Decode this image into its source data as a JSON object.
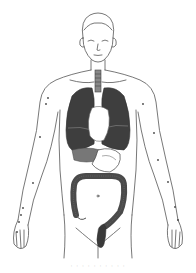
{
  "illustration": {
    "subject": "Human torso anatomical figure showing internal organs",
    "organs": [
      "lungs",
      "trachea",
      "heart",
      "stomach",
      "liver",
      "large-intestine",
      "rectum"
    ],
    "colors": {
      "line": "#555555",
      "organ_dark": "#3e3e3e",
      "organ_mid": "#6a6a6a",
      "background": "#ffffff"
    }
  },
  "caption": {
    "text": "· · · · ·   · · · · ·"
  }
}
